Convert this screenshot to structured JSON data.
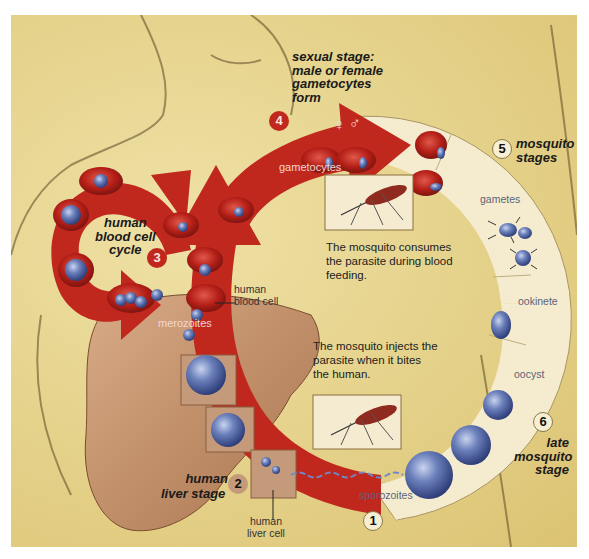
{
  "diagram": {
    "colors": {
      "background": "#e6d48e",
      "human_arrow_red": "#c0281e",
      "mosquito_ring_cream": "#f5ecd0",
      "liver_tan": "#c4966f",
      "parasite_blue": "#5a6fa8"
    },
    "stages": [
      {
        "number": "1",
        "label": "",
        "marker_style": "cream"
      },
      {
        "number": "2",
        "label_lines": [
          "human",
          "liver stage"
        ],
        "marker_style": "tan"
      },
      {
        "number": "3",
        "label_lines": [
          "human",
          "blood cell",
          "cycle"
        ],
        "marker_style": "red"
      },
      {
        "number": "4",
        "label_lines": [
          "sexual stage:",
          "male or female",
          "gametocytes",
          "form"
        ],
        "marker_style": "red"
      },
      {
        "number": "5",
        "label_lines": [
          "mosquito",
          "stages"
        ],
        "marker_style": "cream"
      },
      {
        "number": "6",
        "label_lines": [
          "late",
          "mosquito",
          "stage"
        ],
        "marker_style": "cream"
      }
    ],
    "arrow_labels": {
      "gametocytes": "gametocytes",
      "merozoites": "merozoites",
      "sporozoites": "sporozoites",
      "gametes": "gametes",
      "ookinete": "ookinete",
      "oocyst": "oocyst"
    },
    "pointer_labels": {
      "human_blood_cell": [
        "human",
        "blood cell"
      ],
      "human_liver_cell": [
        "human",
        "liver cell"
      ]
    },
    "captions": {
      "mosquito_consumes": [
        "The mosquito consumes",
        "the parasite during blood",
        "feeding."
      ],
      "mosquito_injects": [
        "The mosquito injects the",
        "parasite when it bites",
        "the human."
      ]
    },
    "symbols": {
      "female": "♀",
      "male": "♂"
    },
    "icons": [
      "mosquito-feeding-icon",
      "mosquito-biting-icon",
      "red-blood-cell-icon",
      "liver-icon",
      "gamete-icon",
      "oocyst-icon"
    ]
  }
}
